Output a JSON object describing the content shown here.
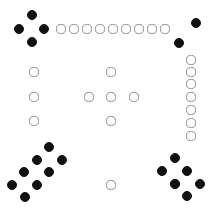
{
  "figure": {
    "width": 213,
    "height": 217,
    "background_color": "#ffffff"
  },
  "legend": {
    "filled_label": "filled token",
    "open_label": "open token",
    "filled_color": "#111111",
    "open_fill_color": "#ffffff",
    "open_stroke_color": "#8d8d8d"
  },
  "counts": {
    "filled_total": 21,
    "open_total": 24,
    "total": 45
  },
  "groups": [
    {
      "name": "top-left-diamond",
      "style": "filled",
      "count": 4,
      "radius": 5.2,
      "tokens": [
        {
          "x": 32,
          "y": 15
        },
        {
          "x": 19,
          "y": 29
        },
        {
          "x": 44,
          "y": 29
        },
        {
          "x": 32,
          "y": 42
        }
      ]
    },
    {
      "name": "top-row-open",
      "style": "open",
      "count": 9,
      "radius": 4.6,
      "tokens": [
        {
          "x": 61,
          "y": 29
        },
        {
          "x": 74,
          "y": 29
        },
        {
          "x": 87,
          "y": 29
        },
        {
          "x": 100,
          "y": 29
        },
        {
          "x": 113,
          "y": 29
        },
        {
          "x": 126,
          "y": 29
        },
        {
          "x": 139,
          "y": 29
        },
        {
          "x": 152,
          "y": 29
        },
        {
          "x": 165,
          "y": 29
        }
      ]
    },
    {
      "name": "top-right-filled",
      "style": "filled",
      "count": 2,
      "radius": 5.2,
      "tokens": [
        {
          "x": 196,
          "y": 23
        },
        {
          "x": 179,
          "y": 43
        }
      ]
    },
    {
      "name": "right-column-open",
      "style": "open",
      "count": 7,
      "radius": 4.6,
      "tokens": [
        {
          "x": 191,
          "y": 60
        },
        {
          "x": 191,
          "y": 72
        },
        {
          "x": 191,
          "y": 84
        },
        {
          "x": 191,
          "y": 97
        },
        {
          "x": 191,
          "y": 110
        },
        {
          "x": 191,
          "y": 123
        },
        {
          "x": 191,
          "y": 136
        }
      ]
    },
    {
      "name": "left-column-open",
      "style": "open",
      "count": 3,
      "radius": 4.6,
      "tokens": [
        {
          "x": 34,
          "y": 72
        },
        {
          "x": 34,
          "y": 97
        },
        {
          "x": 34,
          "y": 121
        }
      ]
    },
    {
      "name": "center-cross-open",
      "style": "open",
      "count": 5,
      "radius": 4.6,
      "tokens": [
        {
          "x": 111,
          "y": 72
        },
        {
          "x": 89,
          "y": 97
        },
        {
          "x": 111,
          "y": 97
        },
        {
          "x": 134,
          "y": 97
        },
        {
          "x": 111,
          "y": 121
        }
      ]
    },
    {
      "name": "center-bottom-open",
      "style": "open",
      "count": 1,
      "radius": 4.6,
      "tokens": [
        {
          "x": 111,
          "y": 185
        }
      ]
    },
    {
      "name": "bottom-left-cluster",
      "style": "filled",
      "count": 8,
      "radius": 5.2,
      "tokens": [
        {
          "x": 49,
          "y": 147
        },
        {
          "x": 37,
          "y": 160
        },
        {
          "x": 62,
          "y": 160
        },
        {
          "x": 24,
          "y": 172
        },
        {
          "x": 49,
          "y": 172
        },
        {
          "x": 12,
          "y": 185
        },
        {
          "x": 37,
          "y": 185
        },
        {
          "x": 25,
          "y": 197
        }
      ]
    },
    {
      "name": "bottom-right-cluster",
      "style": "filled",
      "count": 7,
      "radius": 5.2,
      "tokens": [
        {
          "x": 175,
          "y": 158
        },
        {
          "x": 162,
          "y": 171
        },
        {
          "x": 187,
          "y": 171
        },
        {
          "x": 175,
          "y": 184
        },
        {
          "x": 200,
          "y": 184
        },
        {
          "x": 187,
          "y": 196
        },
        {
          "x": 175,
          "y": 184
        }
      ]
    }
  ]
}
